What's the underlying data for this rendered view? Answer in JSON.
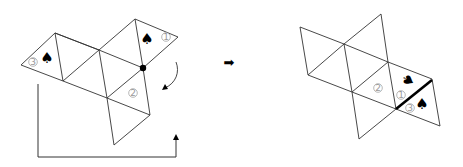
{
  "figure": {
    "left_net": {
      "labels": [
        {
          "id": "face-1",
          "text": "1",
          "x": 166,
          "y": 37
        },
        {
          "id": "face-2",
          "text": "2",
          "x": 133,
          "y": 93
        },
        {
          "id": "face-3",
          "text": "3",
          "x": 33,
          "y": 62
        }
      ],
      "spades": [
        {
          "id": "spade-face-1",
          "glyph": "♠",
          "x": 147,
          "y": 39,
          "rotate": 0
        },
        {
          "id": "spade-face-3",
          "glyph": "♠",
          "x": 47,
          "y": 58,
          "rotate": 0
        }
      ],
      "pivot_dot": {
        "x": 143,
        "y": 68
      },
      "rotation_arrow": "curved-clockwise-arrow",
      "move_bracket": "move-bracket-arrow"
    },
    "transition_arrow": {
      "glyph": "➡"
    },
    "right_net": {
      "labels": [
        {
          "id": "face-1",
          "text": "1",
          "x": 401,
          "y": 95
        },
        {
          "id": "face-2",
          "text": "2",
          "x": 378,
          "y": 88
        },
        {
          "id": "face-3",
          "text": "3",
          "x": 410,
          "y": 108
        }
      ],
      "spades": [
        {
          "id": "spade-face-1",
          "glyph": "♠",
          "x": 408,
          "y": 80,
          "rotate": 120
        },
        {
          "id": "spade-face-3",
          "glyph": "♠",
          "x": 422,
          "y": 104,
          "rotate": 0
        }
      ],
      "bold_edge": {
        "x1": 396,
        "y1": 109,
        "x2": 432,
        "y2": 80
      }
    }
  }
}
